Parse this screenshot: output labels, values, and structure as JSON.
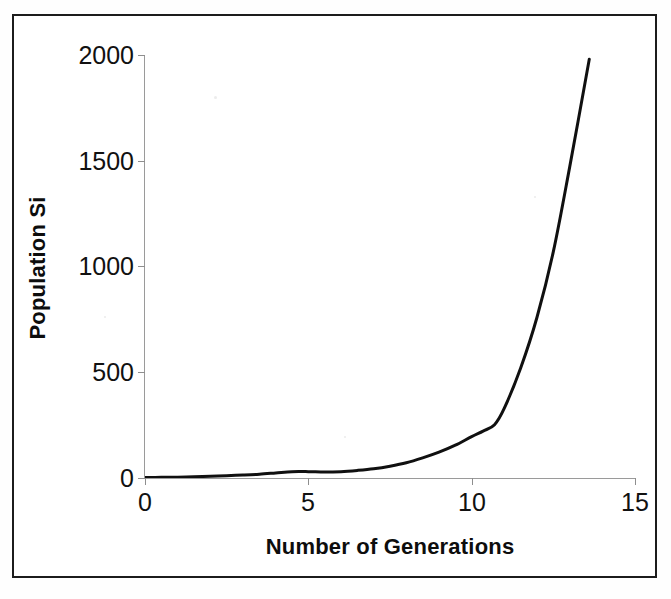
{
  "figure": {
    "background_color": "#ffffff",
    "frame_color": "#1c1c1c",
    "axis_color": "#9a9a9a",
    "series_color": "#101010"
  },
  "chart_data": {
    "type": "line",
    "title": "",
    "xlabel": "Number of Generations",
    "ylabel": "Population Si",
    "xlim": [
      0,
      15
    ],
    "ylim": [
      0,
      2000
    ],
    "xticks": [
      0,
      5,
      10,
      15
    ],
    "yticks": [
      0,
      500,
      1000,
      1500,
      2000
    ],
    "xtick_labels": [
      "0",
      "5",
      "10",
      "15"
    ],
    "ytick_labels": [
      "0",
      "500",
      "1000",
      "1500",
      "2000"
    ],
    "grid": false,
    "legend": null,
    "series": [
      {
        "name": "Population Si",
        "color": "#101010",
        "line_width": 3,
        "markers": false,
        "x": [
          0,
          0.5,
          1,
          1.5,
          2,
          2.5,
          3,
          3.5,
          4,
          4.5,
          5,
          5.5,
          6,
          6.5,
          7,
          7.5,
          8,
          8.5,
          9,
          9.5,
          10,
          10.35,
          10.7,
          11,
          11.5,
          12,
          12.5,
          13,
          13.6
        ],
        "y": [
          2,
          3,
          4,
          6,
          8,
          11,
          14,
          18,
          24,
          30,
          30,
          28,
          30,
          36,
          44,
          56,
          72,
          95,
          122,
          155,
          196,
          222,
          252,
          330,
          520,
          760,
          1070,
          1470,
          1980
        ]
      }
    ],
    "annotations": []
  },
  "axes": {
    "y_title": "Population Si",
    "x_title": "Number of Generations",
    "y_tick_labels": [
      "2000",
      "1500",
      "1000",
      "500",
      "0"
    ],
    "x_tick_labels": [
      "0",
      "5",
      "10",
      "15"
    ]
  }
}
